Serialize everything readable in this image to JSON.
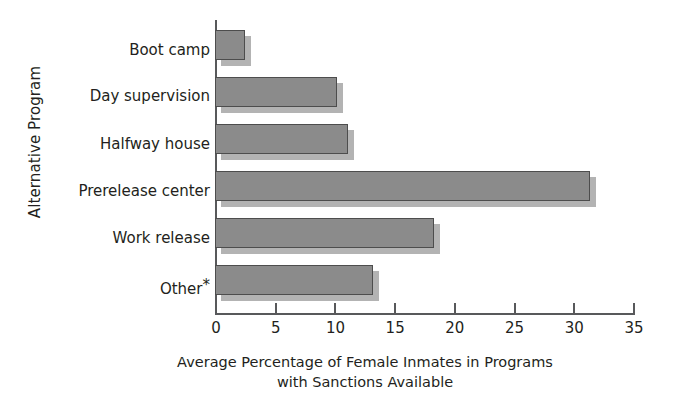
{
  "chart_data": {
    "type": "bar",
    "orientation": "horizontal",
    "title": "",
    "categories": [
      "Boot camp",
      "Day supervision",
      "Halfway house",
      "Prerelease center",
      "Work release",
      "Other*"
    ],
    "values": [
      2.5,
      10.2,
      11.1,
      31.4,
      18.3,
      13.2
    ],
    "xlabel_line1": "Average Percentage of Female Inmates in Programs",
    "xlabel_line2": "with Sanctions Available",
    "ylabel": "Alternative Program",
    "xlim": [
      0,
      35
    ],
    "xticks": [
      0,
      5,
      10,
      15,
      20,
      25,
      30,
      35
    ],
    "xticklabels": [
      "0",
      "5",
      "10",
      "15",
      "20",
      "25",
      "30",
      "35"
    ],
    "grid": false,
    "legend": false,
    "bar_fill_color": "#8b8b8b",
    "bar_edge_color": "#4d4d4d",
    "bar_shadow_color": "#b3b3b3",
    "axis_color": "#58595b",
    "text_color": "#231f20",
    "background_color": "#ffffff"
  },
  "axes": {
    "y_title": "Alternative Program",
    "x_title_line1": "Average Percentage of Female Inmates in Programs",
    "x_title_line2": "with Sanctions Available"
  },
  "categories": {
    "c0": "Boot camp",
    "c1": "Day supervision",
    "c2": "Halfway house",
    "c3": "Prerelease center",
    "c4": "Work release",
    "c5_text": "Other",
    "c5_star": "*"
  },
  "ticks": {
    "t0": "0",
    "t1": "5",
    "t2": "10",
    "t3": "15",
    "t4": "20",
    "t5": "25",
    "t6": "30",
    "t7": "35"
  }
}
